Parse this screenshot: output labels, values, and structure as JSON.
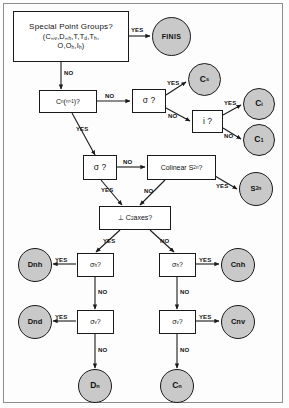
{
  "diagram": {
    "fill_terminal": "#c9c9c9",
    "fill_decision": "#ffffff",
    "stroke": "#1a1a1a"
  },
  "nodes": {
    "start": {
      "kind": "decision",
      "line1": "Special Point Groups?",
      "line2": "(C∞v,D∞h,T,Td,Th,",
      "line3": "O,Oh,Ih)"
    },
    "finis": {
      "kind": "terminal",
      "label": "FINIS"
    },
    "cn_axis": {
      "kind": "decision",
      "label": "Cn(n>1)?"
    },
    "sigma_top": {
      "kind": "decision",
      "label": "σ ?"
    },
    "cs": {
      "kind": "terminal",
      "label": "Cs"
    },
    "inversion": {
      "kind": "decision",
      "label": "i ?"
    },
    "ci": {
      "kind": "terminal",
      "label": "Ci"
    },
    "c1": {
      "kind": "terminal",
      "label": "C1"
    },
    "sigma_mid": {
      "kind": "decision",
      "label": "σ ?"
    },
    "colinear_s2n": {
      "kind": "decision",
      "label": "Colinear  S2n?"
    },
    "s2n": {
      "kind": "terminal",
      "label": "S2n"
    },
    "perp_c2": {
      "kind": "decision",
      "label": "⊥ C2 axes?"
    },
    "sigma_h_left": {
      "kind": "decision",
      "label": "σh?"
    },
    "dnh": {
      "kind": "terminal",
      "label": "Dnh"
    },
    "sigma_v_left": {
      "kind": "decision",
      "label": "σv?"
    },
    "dnd": {
      "kind": "terminal",
      "label": "Dnd"
    },
    "dn": {
      "kind": "terminal",
      "label": "Dn"
    },
    "sigma_h_right": {
      "kind": "decision",
      "label": "σh?"
    },
    "cnh": {
      "kind": "terminal",
      "label": "Cnh"
    },
    "sigma_v_right": {
      "kind": "decision",
      "label": "σv?"
    },
    "cnv": {
      "kind": "terminal",
      "label": "Cnv"
    },
    "cn": {
      "kind": "terminal",
      "label": "Cn"
    }
  },
  "edge_labels": {
    "start_yes": "YES",
    "start_no": "NO",
    "cn_axis_no": "NO",
    "cn_axis_yes": "YES",
    "sigma_top_yes": "YES",
    "sigma_top_no": "NO",
    "inversion_yes": "YES",
    "inversion_no": "NO",
    "sigma_mid_no": "NO",
    "sigma_mid_yes": "YES",
    "colinear_yes": "YES",
    "colinear_no": "NO",
    "perp_yes": "YES",
    "perp_no": "NO",
    "sigma_h_left_yes": "YES",
    "sigma_h_left_no": "NO",
    "sigma_v_left_yes": "YES",
    "sigma_v_left_no": "NO",
    "sigma_h_right_yes": "YES",
    "sigma_h_right_no": "NO",
    "sigma_v_right_yes": "YES",
    "sigma_v_right_no": "NO"
  }
}
